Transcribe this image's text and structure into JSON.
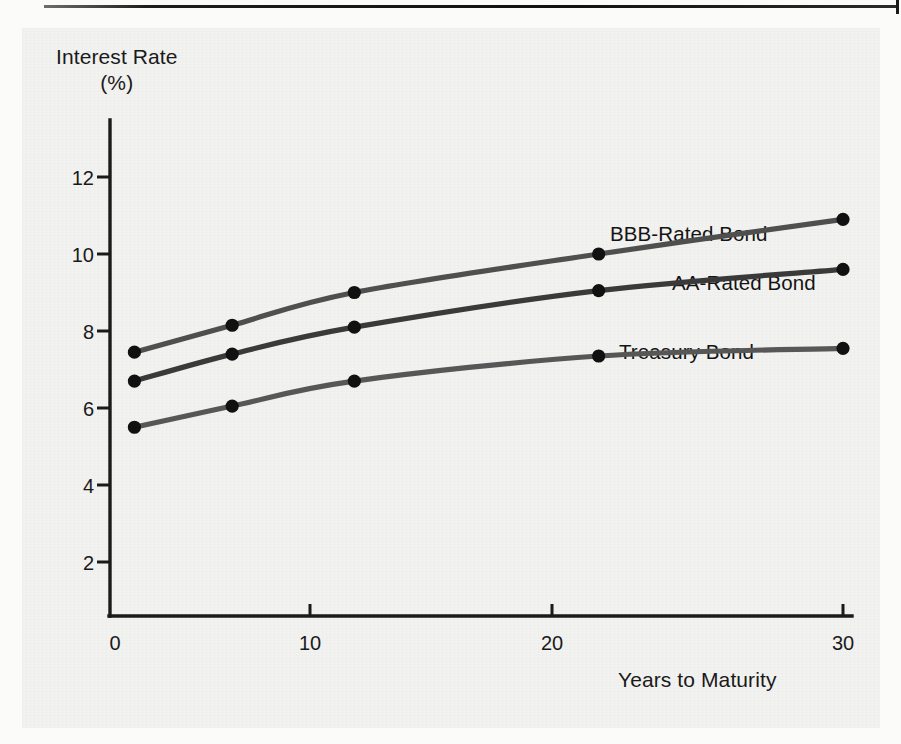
{
  "figure": {
    "background_color": "#f2f2f0",
    "ink_color": "#1a1a1a"
  },
  "chart_data": {
    "type": "line",
    "title": "",
    "subtitle": "",
    "xlabel": "Years to Maturity",
    "ylabel": "Interest Rate",
    "ylabel_units": "(%)",
    "ylabel_full": "Interest Rate (%)",
    "x": [
      1,
      5,
      10,
      20,
      30
    ],
    "xlim": [
      0,
      31.5
    ],
    "ylim": [
      0,
      13.2
    ],
    "xticks": [
      0,
      10,
      20,
      30
    ],
    "xtick_labels": [
      "0",
      "10",
      "20",
      "30"
    ],
    "yticks": [
      2,
      4,
      6,
      8,
      10,
      12
    ],
    "ytick_labels": [
      "2",
      "4",
      "6",
      "8",
      "10",
      "12"
    ],
    "grid": false,
    "legend_position": "inline-right-of-curves",
    "marker": "filled-circle",
    "series": [
      {
        "name": "BBB-Rated Bond",
        "color": "#4f4f4f",
        "label_x": 30,
        "values": [
          7.45,
          8.15,
          9.0,
          10.0,
          10.9
        ]
      },
      {
        "name": "AA-Rated Bond",
        "color": "#3a3a3a",
        "label_x": 30,
        "values": [
          6.7,
          7.4,
          8.1,
          9.05,
          9.6
        ]
      },
      {
        "name": "Treasury Bond",
        "color": "#575757",
        "label_x": 30,
        "values": [
          5.5,
          6.05,
          6.7,
          7.35,
          7.55
        ]
      }
    ]
  },
  "annotations": {
    "series_labels": [
      "BBB-Rated Bond",
      "AA-Rated Bond",
      "Treasury Bond"
    ]
  }
}
